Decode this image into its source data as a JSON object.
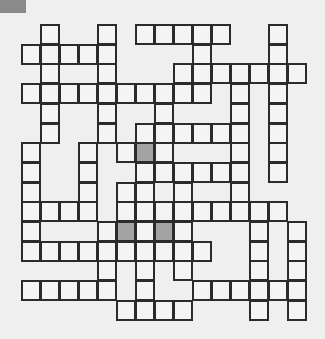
{
  "puzzle": {
    "type": "crossword-grid",
    "columns": 15,
    "rows": 15,
    "cell_width": 19,
    "cell_height": 19.7,
    "colors": {
      "background": "#efefef",
      "cell": "#f4f4f4",
      "border": "#2b2b2b",
      "shaded": "#a3a3a3",
      "tab": "#8a8a8a"
    },
    "grid_rows": [
      {
        "row": 0,
        "cells": [
          1,
          4,
          6,
          7,
          8,
          9,
          10,
          13
        ],
        "shaded": []
      },
      {
        "row": 1,
        "cells": [
          0,
          1,
          2,
          3,
          4,
          9,
          13
        ],
        "shaded": []
      },
      {
        "row": 2,
        "cells": [
          1,
          4,
          8,
          9,
          10,
          11,
          12,
          13,
          14
        ],
        "shaded": []
      },
      {
        "row": 3,
        "cells": [
          0,
          1,
          2,
          3,
          4,
          5,
          6,
          7,
          8,
          9,
          11,
          13
        ],
        "shaded": []
      },
      {
        "row": 4,
        "cells": [
          1,
          4,
          7,
          11,
          13
        ],
        "shaded": []
      },
      {
        "row": 5,
        "cells": [
          1,
          4,
          6,
          7,
          8,
          9,
          10,
          11,
          13
        ],
        "shaded": []
      },
      {
        "row": 6,
        "cells": [
          0,
          3,
          5,
          6,
          7,
          11,
          13
        ],
        "shaded": [
          6
        ]
      },
      {
        "row": 7,
        "cells": [
          0,
          3,
          6,
          7,
          8,
          9,
          10,
          11,
          13
        ],
        "shaded": []
      },
      {
        "row": 8,
        "cells": [
          0,
          3,
          5,
          6,
          8,
          11
        ],
        "shaded": []
      },
      {
        "row": 9,
        "cells": [
          0,
          1,
          2,
          3,
          5,
          6,
          7,
          8,
          9,
          10,
          11,
          12,
          13
        ],
        "shaded": []
      },
      {
        "row": 10,
        "cells": [
          0,
          4,
          5,
          6,
          7,
          8,
          12,
          14
        ],
        "shaded": [
          5,
          7
        ]
      },
      {
        "row": 11,
        "cells": [
          0,
          1,
          2,
          3,
          4,
          5,
          6,
          7,
          8,
          9,
          12,
          14
        ],
        "shaded": []
      },
      {
        "row": 12,
        "cells": [
          4,
          6,
          8,
          12,
          14
        ],
        "shaded": []
      },
      {
        "row": 13,
        "cells": [
          0,
          1,
          2,
          3,
          4,
          6,
          9,
          10,
          11,
          12,
          13,
          14
        ],
        "shaded": []
      },
      {
        "row": 14,
        "cells": [
          5,
          6,
          7,
          8,
          12,
          14
        ],
        "shaded": []
      }
    ]
  }
}
